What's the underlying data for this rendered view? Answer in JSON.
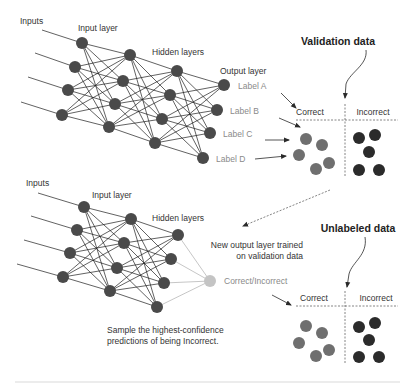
{
  "colors": {
    "node": "#4a4a4a",
    "node_gray": "#c4c4c4",
    "correct_dot": "#6f6f6f",
    "incorrect_dot": "#2b2b2b",
    "edge": "#1e1e1e",
    "edge_gray": "#b8b8b8",
    "label_gray": "#8a8a8a"
  },
  "top_network": {
    "inputs_label": "Inputs",
    "input_layer_label": "Input layer",
    "hidden_layers_label": "Hidden layers",
    "output_layer_label": "Output layer",
    "output_labels": [
      "Label A",
      "Label B",
      "Label C",
      "Label D"
    ],
    "layers": [
      [
        [
          82,
          43
        ],
        [
          75,
          67
        ],
        [
          68,
          90
        ],
        [
          62,
          115
        ]
      ],
      [
        [
          130,
          55
        ],
        [
          123,
          81
        ],
        [
          115,
          104
        ],
        [
          109,
          127
        ]
      ],
      [
        [
          177,
          71
        ],
        [
          170,
          95
        ],
        [
          162,
          119
        ],
        [
          155,
          143
        ]
      ],
      [
        [
          224,
          85
        ],
        [
          217,
          110
        ],
        [
          210,
          133
        ],
        [
          203,
          158
        ]
      ]
    ],
    "input_lines": [
      [
        [
          42,
          30
        ],
        [
          82,
          43
        ]
      ],
      [
        [
          35,
          53
        ],
        [
          75,
          67
        ]
      ],
      [
        [
          28,
          77
        ],
        [
          68,
          90
        ]
      ],
      [
        [
          21,
          102
        ],
        [
          62,
          115
        ]
      ]
    ]
  },
  "validation_panel": {
    "title": "Validation data",
    "correct_label": "Correct",
    "incorrect_label": "Incorrect",
    "correct_dots": [
      [
        306,
        139
      ],
      [
        322,
        145
      ],
      [
        299,
        155
      ],
      [
        316,
        169
      ],
      [
        329,
        163
      ]
    ],
    "incorrect_dots": [
      [
        359,
        138
      ],
      [
        375,
        135
      ],
      [
        369,
        152
      ],
      [
        359,
        170
      ],
      [
        379,
        170
      ]
    ]
  },
  "bottom_network": {
    "inputs_label": "Inputs",
    "input_layer_label": "Input layer",
    "hidden_layers_label": "Hidden layers",
    "output_label": "Correct/Incorrect",
    "layers": [
      [
        [
          84,
          207
        ],
        [
          77,
          230
        ],
        [
          70,
          253
        ],
        [
          63,
          277
        ]
      ],
      [
        [
          131,
          219
        ],
        [
          124,
          243
        ],
        [
          117,
          268
        ],
        [
          110,
          291
        ]
      ],
      [
        [
          178,
          235
        ],
        [
          171,
          259
        ],
        [
          164,
          283
        ],
        [
          157,
          307
        ]
      ]
    ],
    "output_node": [
      210,
      281
    ],
    "input_lines": [
      [
        [
          38,
          193
        ],
        [
          84,
          207
        ]
      ],
      [
        [
          31,
          216
        ],
        [
          77,
          230
        ]
      ],
      [
        [
          24,
          240
        ],
        [
          70,
          253
        ]
      ],
      [
        [
          17,
          264
        ],
        [
          63,
          277
        ]
      ]
    ],
    "annotation_line1": "Sample the highest-confidence",
    "annotation_line2": "predictions of being Incorrect."
  },
  "transfer_note": {
    "line1": "New output layer trained",
    "line2": "on validation data"
  },
  "unlabeled_panel": {
    "title": "Unlabeled data",
    "correct_label": "Correct",
    "incorrect_label": "Incorrect",
    "correct_dots": [
      [
        306,
        326
      ],
      [
        322,
        333
      ],
      [
        299,
        343
      ],
      [
        316,
        356
      ],
      [
        329,
        350
      ]
    ],
    "incorrect_dots": [
      [
        359,
        327
      ],
      [
        375,
        323
      ],
      [
        369,
        340
      ],
      [
        359,
        357
      ],
      [
        379,
        357
      ]
    ]
  }
}
